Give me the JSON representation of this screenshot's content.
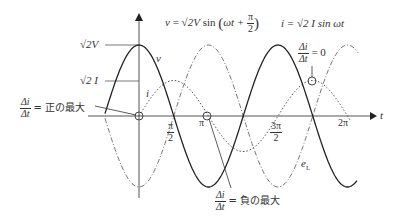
{
  "equations": {
    "v_eq": "v = √2V sin(ωt + π/2)",
    "v_lhs": "v",
    "v_rhs_coef": "√2V",
    "v_sin": "sin",
    "v_arg": "ωt +",
    "v_arg_num": "π",
    "v_arg_den": "2",
    "i_eq": "i = √2 I sin ωt"
  },
  "labels": {
    "sqrt2V": "√2V",
    "sqrt2I": "√2 I",
    "v_curve": "v",
    "i_curve": "i",
    "eL_curve": "e",
    "eL_sub": "L",
    "t_axis": "t",
    "ticks": {
      "pi_half_num": "π",
      "pi_half_den": "2",
      "pi": "π",
      "three_pi_half_num": "3π",
      "three_pi_half_den": "2",
      "two_pi": "2π"
    },
    "delta_num": "Δi",
    "delta_den": "Δt",
    "pos_max": "= 正の最大",
    "neg_max": "= 負の最大",
    "zero": "= 0"
  },
  "chart_data": {
    "type": "line",
    "xlabel": "t",
    "ylabel": "",
    "x_ticks": [
      "π/2",
      "π",
      "3π/2",
      "2π"
    ],
    "series": [
      {
        "name": "v",
        "formula": "√2V sin(ωt + π/2)",
        "style": "solid",
        "amplitude": 1.0,
        "phase": "cos"
      },
      {
        "name": "i",
        "formula": "√2 I sin ωt",
        "style": "dotted",
        "amplitude": 0.5,
        "phase": "sin"
      },
      {
        "name": "e_L",
        "style": "dash-dot",
        "amplitude": 1.0,
        "phase": "-cos"
      }
    ],
    "annotations": [
      {
        "text": "Δi/Δt = 正の最大",
        "at": "t=0"
      },
      {
        "text": "Δi/Δt = 負の最大",
        "at": "t=π"
      },
      {
        "text": "Δi/Δt = 0",
        "at": "t=π/2 (i peak)"
      }
    ]
  },
  "colors": {
    "line": "#222222",
    "axis": "#555555",
    "dashed": "#666666"
  }
}
